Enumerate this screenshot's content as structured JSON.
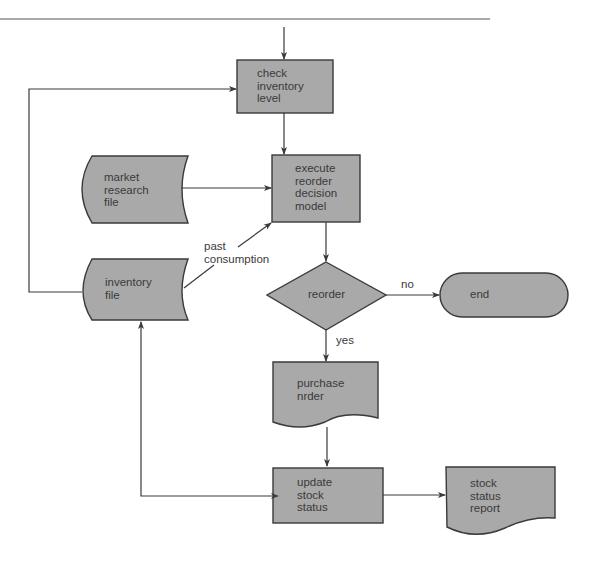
{
  "diagram": {
    "type": "flowchart",
    "colors": {
      "shape_fill": "#a9a9a9",
      "stroke": "#3a3a3a",
      "text": "#3a3a3a",
      "background": "#ffffff"
    },
    "nodes": {
      "check_inventory": {
        "shape": "process",
        "label": "check\ninventory\nlevel"
      },
      "execute_model": {
        "shape": "process",
        "label": "execute\nreorder\ndecision\nmodel"
      },
      "market_research_file": {
        "shape": "stored-data",
        "label": "market\nresearch\nfile"
      },
      "inventory_file": {
        "shape": "stored-data",
        "label": "inventory\nfile"
      },
      "reorder_decision": {
        "shape": "decision",
        "label": "reorder"
      },
      "end": {
        "shape": "terminator",
        "label": "end"
      },
      "purchase_order": {
        "shape": "document",
        "label": "purchase\nnrder"
      },
      "update_stock_status": {
        "shape": "process",
        "label": "update\nstock\nstatus"
      },
      "stock_status_report": {
        "shape": "document",
        "label": "stock\nstatus\nreport"
      }
    },
    "edge_labels": {
      "past_consumption": "past\nconsumption",
      "no": "no",
      "yes": "yes"
    },
    "edges": [
      {
        "from": "entry",
        "to": "check_inventory"
      },
      {
        "from": "check_inventory",
        "to": "execute_model"
      },
      {
        "from": "market_research_file",
        "to": "execute_model"
      },
      {
        "from": "inventory_file",
        "to": "execute_model",
        "label": "past consumption"
      },
      {
        "from": "inventory_file",
        "to": "check_inventory"
      },
      {
        "from": "execute_model",
        "to": "reorder_decision"
      },
      {
        "from": "reorder_decision",
        "to": "end",
        "label": "no"
      },
      {
        "from": "reorder_decision",
        "to": "purchase_order",
        "label": "yes"
      },
      {
        "from": "purchase_order",
        "to": "update_stock_status"
      },
      {
        "from": "update_stock_status",
        "to": "inventory_file",
        "bidirectional": true
      },
      {
        "from": "update_stock_status",
        "to": "stock_status_report"
      }
    ]
  }
}
